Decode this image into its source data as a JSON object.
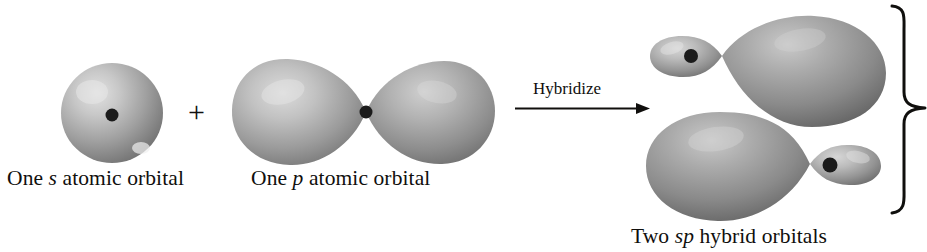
{
  "figure": {
    "background_color": "#ffffff",
    "ink_color": "#100f0d",
    "orbital_fill_light": "#d8d8d8",
    "orbital_fill_mid": "#9a9a9a",
    "orbital_fill_dark": "#6b6b6b",
    "nucleus_color": "#1b1b1b"
  },
  "reactants": {
    "s_orbital": {
      "label_prefix": "One ",
      "label_italic": "s",
      "label_suffix": " atomic orbital",
      "shape": "sphere"
    },
    "plus": "+",
    "p_orbital": {
      "label_prefix": "One ",
      "label_italic": "p",
      "label_suffix": " atomic orbital",
      "shape": "two-lobe-dumbbell"
    }
  },
  "arrow": {
    "label": "Hybridize",
    "direction": "right"
  },
  "products": {
    "label_prefix": "Two ",
    "label_italic": "sp",
    "label_suffix": " hybrid orbitals",
    "count": 2,
    "orbitals": [
      {
        "name": "sp-hybrid-top",
        "small_lobe_side": "left",
        "large_lobe_side": "right"
      },
      {
        "name": "sp-hybrid-bottom",
        "small_lobe_side": "right",
        "large_lobe_side": "left"
      }
    ],
    "brace": "}"
  }
}
